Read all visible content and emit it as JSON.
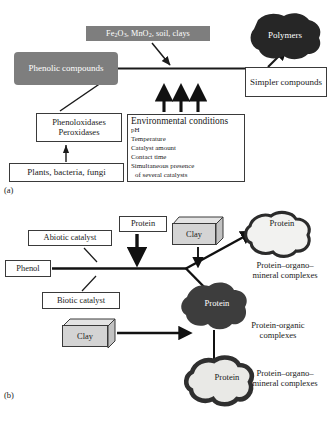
{
  "figure": {
    "panel_a": {
      "caption": "(a)",
      "nodes": {
        "oxides": "Fe2O3, MnO2, soil, clays",
        "oxides_parts": {
          "fe": "Fe",
          "fe_sub1": "2",
          "o": "O",
          "o_sub": "3",
          "sep1": ", ",
          "mn": "MnO",
          "mn_sub": "2",
          "rest": ", soil, clays"
        },
        "phenolic_compounds": "Phenolic compounds",
        "polymers": "Polymers",
        "simpler_compounds": "Simpler compounds",
        "enzymes_line1": "Phenoloxidases",
        "enzymes_line2": "Peroxidases",
        "sources": "Plants, bacteria, fungi",
        "environmental_title": "Environmental conditions",
        "environmental_items": [
          "pH",
          "Temperature",
          "Catalyst amount",
          "Contact time",
          "Simultaneous presence",
          "of several catalysts"
        ]
      }
    },
    "panel_b": {
      "caption": "(b)",
      "nodes": {
        "abiotic_catalyst": "Abiotic catalyst",
        "biotic_catalyst": "Biotic catalyst",
        "phenol": "Phenol",
        "protein_box": "Protein",
        "clay_top": "Clay",
        "clay_bottom": "Clay",
        "protein_blob_top": "Protein",
        "protein_blob_mid": "Protein",
        "protein_blob_bottom": "Protein",
        "protein_organo_mineral_1_line1": "Protein–organo–",
        "protein_organo_mineral_1_line2": "mineral complexes",
        "protein_organic_line1": "Protein-organic",
        "protein_organic_line2": "complexes",
        "protein_organo_mineral_2_line1": "Protein–organo–",
        "protein_organo_mineral_2_line2": "mineral complexes"
      }
    },
    "colors": {
      "gray_fill": "#7e7e7e",
      "blob_dark": "#2b2b2b",
      "blob_mid": "#4a4a4a",
      "clay_fill": "#d4d4d4",
      "outline": "#3a3a3a"
    }
  }
}
